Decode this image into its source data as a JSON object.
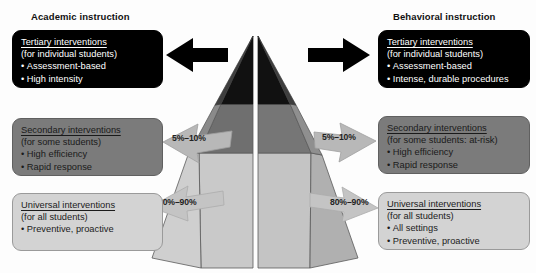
{
  "columns": {
    "left": {
      "title": "Academic instruction",
      "tiers": [
        {
          "id": "tertiary",
          "heading": "Tertiary interventions",
          "subtitle": "(for individual students)",
          "bullets": [
            "Assessment-based",
            "High intensity"
          ],
          "fill": "#000000",
          "text": "#ffffff"
        },
        {
          "id": "secondary",
          "heading": "Secondary interventions",
          "subtitle": "(for some students)",
          "bullets": [
            "High efficiency",
            "Rapid response"
          ],
          "fill": "#7b7b7b",
          "text": "#1a1a1a"
        },
        {
          "id": "universal",
          "heading": "Universal interventions",
          "subtitle": "(for all students)",
          "bullets": [
            "Preventive, proactive"
          ],
          "fill": "#d3d3d3",
          "text": "#1c1c1c"
        }
      ],
      "percent_secondary": "5%–10%",
      "percent_universal": "80%–90%"
    },
    "right": {
      "title": "Behavioral instruction",
      "tiers": [
        {
          "id": "tertiary",
          "heading": "Tertiary interventions",
          "subtitle": "(for individual students)",
          "bullets": [
            "Assessment-based",
            "Intense, durable procedures"
          ],
          "fill": "#000000",
          "text": "#ffffff"
        },
        {
          "id": "secondary",
          "heading": "Secondary interventions",
          "subtitle": "(for some students: at-risk)",
          "bullets": [
            "High efficiency",
            "Rapid response"
          ],
          "fill": "#7b7b7b",
          "text": "#1a1a1a"
        },
        {
          "id": "universal",
          "heading": "Universal interventions",
          "subtitle": "(for all students)",
          "bullets": [
            "All settings",
            "Preventive, proactive"
          ],
          "fill": "#d3d3d3",
          "text": "#1c1c1c"
        }
      ],
      "percent_secondary": "5%–10%",
      "percent_universal": "80%–90%"
    }
  },
  "pyramid": {
    "tier_colors": {
      "tertiary_front": "#111111",
      "tertiary_side": "#4a4a4a",
      "secondary_front": "#6f6f6f",
      "secondary_side": "#8c8c8c",
      "universal_front": "#c9c9c9",
      "universal_side": "#a8a8a8"
    },
    "outline": "#5a5a5a"
  },
  "arrows": {
    "tertiary_color": "#000000",
    "tier_arrow_color": "#b8b8b8",
    "tier_arrow_outline": "#9a9a9a"
  }
}
